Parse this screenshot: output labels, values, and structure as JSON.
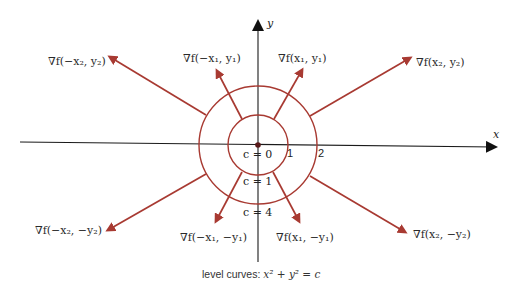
{
  "diagram": {
    "colors": {
      "axis": "#1a1a1a",
      "curve": "#a83a32",
      "arrow": "#a83a32",
      "text": "#2a2a2a"
    },
    "axes": {
      "x_label": "x",
      "y_label": "y"
    },
    "circle_labels": {
      "inner_radius": "1",
      "outer_radius": "2"
    },
    "level_labels": [
      {
        "id": "c0",
        "text": "c = 0"
      },
      {
        "id": "c1",
        "text": "c = 1"
      },
      {
        "id": "c4",
        "text": "c = 4"
      }
    ],
    "gradient_labels": {
      "neg_x2_y2": "∇f(−x₂, y₂)",
      "neg_x1_y1": "∇f(−x₁, y₁)",
      "x1_y1": "∇f(x₁, y₁)",
      "x2_y2": "∇f(x₂, y₂)",
      "neg_x2_neg_y2": "∇f(−x₂, −y₂)",
      "neg_x1_neg_y1": "∇f(−x₁, −y₁)",
      "x1_neg_y1": "∇f(x₁, −y₁)",
      "x2_neg_y2": "∇f(x₂, −y₂)"
    },
    "caption": {
      "prefix": "level curves:",
      "equation": "x² + y² = c"
    }
  }
}
